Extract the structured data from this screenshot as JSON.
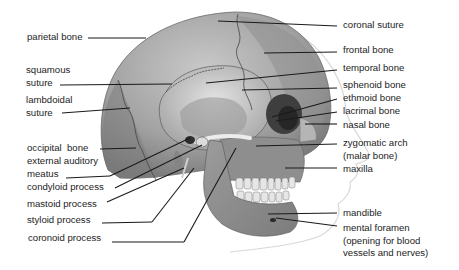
{
  "diagram": {
    "colors": {
      "bone_light": "#d9d9d9",
      "bone_mid": "#a9a9a9",
      "bone_dark": "#6e6e6e",
      "leader_line": "#1a1a1a",
      "text": "#1d1d1d"
    },
    "labels_left": [
      {
        "id": "parietal-bone",
        "lines": [
          "parietal bone"
        ]
      },
      {
        "id": "squamous-suture",
        "lines": [
          "squamous",
          "suture"
        ]
      },
      {
        "id": "lambdoidal-suture",
        "lines": [
          "lambdoidal",
          "suture"
        ]
      },
      {
        "id": "occipital-bone",
        "lines": [
          "occipital  bone"
        ]
      },
      {
        "id": "external-auditory-meatus",
        "lines": [
          "external auditory",
          "meatus"
        ]
      },
      {
        "id": "condyloid-process",
        "lines": [
          "condyloid process"
        ]
      },
      {
        "id": "mastoid-process",
        "lines": [
          "mastoid process"
        ]
      },
      {
        "id": "styloid-process",
        "lines": [
          "styloid process"
        ]
      },
      {
        "id": "coronoid-process",
        "lines": [
          "coronoid process"
        ]
      }
    ],
    "labels_right": [
      {
        "id": "coronal-suture",
        "lines": [
          "coronal suture"
        ]
      },
      {
        "id": "frontal-bone",
        "lines": [
          "frontal bone"
        ]
      },
      {
        "id": "temporal-bone",
        "lines": [
          "temporal bone"
        ]
      },
      {
        "id": "sphenoid-bone",
        "lines": [
          "sphenoid bone"
        ]
      },
      {
        "id": "ethmoid-bone",
        "lines": [
          "ethmoid bone"
        ]
      },
      {
        "id": "lacrimal-bone",
        "lines": [
          "lacrimal bone"
        ]
      },
      {
        "id": "nasal-bone",
        "lines": [
          "nasal bone"
        ]
      },
      {
        "id": "zygomatic-arch",
        "lines": [
          "zygomatic arch",
          "(malar bone)"
        ]
      },
      {
        "id": "maxilla",
        "lines": [
          "maxilla"
        ]
      },
      {
        "id": "mandible",
        "lines": [
          "mandible"
        ]
      },
      {
        "id": "mental-foramen",
        "lines": [
          "mental foramen",
          "(opening for blood",
          "vessels and nerves)"
        ]
      }
    ]
  }
}
